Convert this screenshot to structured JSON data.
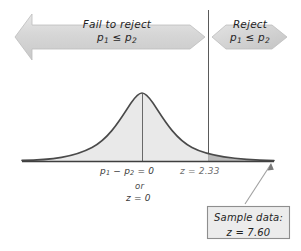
{
  "figure": {
    "title_alt": "Hypothesis test decision diagram for two-proportion z test",
    "bands": {
      "fail_to_reject": {
        "label_line1": "Fail to reject",
        "label_line2_prefix": "p",
        "label_line2_sub1": "1",
        "label_line2_op": " ≤ ",
        "label_line2_prefix2": "p",
        "label_line2_sub2": "2",
        "arrow_name": "fail-to-reject-band"
      },
      "reject": {
        "label_line1": "Reject",
        "label_line2_prefix": "p",
        "label_line2_sub1": "1",
        "label_line2_op": " ≤ ",
        "label_line2_prefix2": "p",
        "label_line2_sub2": "2",
        "arrow_name": "reject-band"
      }
    },
    "axis_labels": {
      "mean_line1_a": "p",
      "mean_line1_sub_a": "1",
      "mean_line1_minus": " − ",
      "mean_line1_b": "p",
      "mean_line1_sub_b": "2",
      "mean_line1_eq": " = 0",
      "mean_or": "or",
      "mean_z": "z = 0",
      "critical_value": "z = 2.33"
    },
    "callout": {
      "line1": "Sample data:",
      "line2": "z = 7.60"
    },
    "colors": {
      "arrow_fill": "#d8d8d8",
      "arrow_stroke": "#b5b5b5",
      "curve_stroke": "#4a4a4a",
      "fill_light": "#e9e9e9",
      "fill_dark": "#b9b9b9",
      "axis_line": "#3f3f3f",
      "box_border": "#8e8e8e",
      "box_fill": "#ececec",
      "pointer": "#9a9a9a",
      "background": "#ffffff"
    },
    "geometry": {
      "baseline_y": 161,
      "baseline_x_start": 22,
      "baseline_x_end": 274,
      "mean_x": 142,
      "critical_x": 208,
      "curve_peak_y": 93
    }
  }
}
